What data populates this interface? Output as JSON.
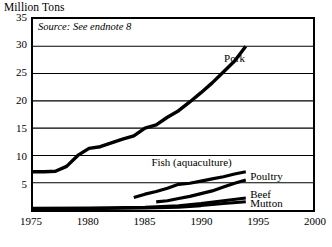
{
  "figure": {
    "axis_title": "Million Tons",
    "source_note": "Source: See endnote 8"
  },
  "chart_data": {
    "type": "line",
    "title": "",
    "subtitle": "",
    "xlabel": "",
    "ylabel": "Million Tons",
    "xlim": [
      1975,
      2000
    ],
    "ylim": [
      0,
      35
    ],
    "xticks": [
      1975,
      1980,
      1985,
      1990,
      1995,
      2000
    ],
    "yticks": [
      5,
      10,
      15,
      20,
      25,
      30,
      35
    ],
    "xtick_labels": [
      "1975",
      "1980",
      "1985",
      "1990",
      "1995",
      "2000"
    ],
    "ytick_labels": [
      "5",
      "10",
      "15",
      "20",
      "25",
      "30",
      "35"
    ],
    "grid": "horizontal",
    "legend": "inline-right",
    "annotations": [
      "Source: See endnote 8"
    ],
    "line_color": "#000000",
    "series": [
      {
        "name": "Pork",
        "label": "Pork",
        "x": [
          1975,
          1976,
          1977,
          1978,
          1979,
          1980,
          1981,
          1982,
          1983,
          1984,
          1985,
          1986,
          1987,
          1988,
          1989,
          1990,
          1991,
          1992,
          1993,
          1994
        ],
        "values": [
          7.0,
          7.0,
          7.1,
          8.0,
          10.0,
          11.3,
          11.6,
          12.3,
          13.0,
          13.6,
          15.0,
          15.6,
          17.0,
          18.2,
          19.8,
          21.5,
          23.3,
          25.3,
          27.3,
          30.0
        ]
      },
      {
        "name": "Fish (aquaculture)",
        "label": "Fish (aquaculture)",
        "x": [
          1984,
          1985,
          1986,
          1987,
          1988,
          1989,
          1990,
          1991,
          1992,
          1993,
          1994
        ],
        "values": [
          2.3,
          2.9,
          3.4,
          4.0,
          4.7,
          4.9,
          5.3,
          5.7,
          6.1,
          6.6,
          7.0
        ]
      },
      {
        "name": "Poultry",
        "label": "Poultry",
        "x": [
          1986,
          1987,
          1988,
          1989,
          1990,
          1991,
          1992,
          1993,
          1994
        ],
        "values": [
          1.5,
          1.7,
          2.1,
          2.5,
          3.0,
          3.5,
          4.2,
          4.9,
          5.5
        ]
      },
      {
        "name": "Beef",
        "label": "Beef",
        "x": [
          1975,
          1980,
          1985,
          1988,
          1990,
          1992,
          1994
        ],
        "values": [
          0.3,
          0.35,
          0.5,
          0.8,
          1.2,
          1.7,
          2.2
        ]
      },
      {
        "name": "Mutton",
        "label": "Mutton",
        "x": [
          1975,
          1980,
          1985,
          1988,
          1990,
          1992,
          1994
        ],
        "values": [
          0.2,
          0.25,
          0.35,
          0.5,
          0.8,
          1.2,
          1.5
        ]
      }
    ],
    "series_label_positions": [
      {
        "name": "Pork",
        "x": 1992.0,
        "y": 27.6
      },
      {
        "name": "Fish (aquaculture)",
        "x": 1985.6,
        "y": 9.0
      },
      {
        "name": "Poultry",
        "x": 1994.3,
        "y": 6.4
      },
      {
        "name": "Beef",
        "x": 1994.3,
        "y": 3.3
      },
      {
        "name": "Mutton",
        "x": 1994.3,
        "y": 1.7
      }
    ]
  }
}
